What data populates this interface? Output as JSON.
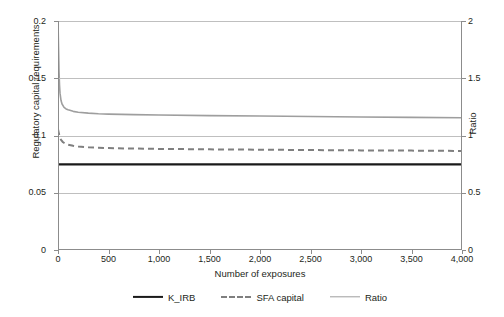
{
  "chart_data": {
    "type": "line",
    "title": "",
    "xlabel": "Number of exposures",
    "ylabel": "Regulatory capital requirements",
    "y2label": "Ratio",
    "xlim": [
      0,
      4000
    ],
    "ylim": [
      0,
      0.2
    ],
    "y2lim": [
      0,
      2
    ],
    "grid": true,
    "legend_position": "bottom",
    "xticks": [
      0,
      500,
      1000,
      1500,
      2000,
      2500,
      3000,
      3500,
      4000
    ],
    "xticklabels": [
      "0",
      "500",
      "1,000",
      "1,500",
      "2,000",
      "2,500",
      "3,000",
      "3,500",
      "4,000"
    ],
    "yticks": [
      0,
      0.05,
      0.1,
      0.15,
      0.2
    ],
    "yticklabels": [
      "0",
      "0.05",
      "0.1",
      "0.15",
      "0.2"
    ],
    "y2ticks": [
      0,
      0.5,
      1,
      1.5,
      2
    ],
    "y2ticklabels": [
      "0",
      "0.5",
      "1",
      "1.5",
      "2"
    ],
    "series": [
      {
        "name": "K_IRB",
        "axis": "left",
        "style": "solid",
        "color": "#1a1a1a",
        "width": 2.2,
        "x": [
          0,
          25,
          50,
          100,
          200,
          300,
          500,
          750,
          1000,
          1500,
          2000,
          2500,
          3000,
          3500,
          4000
        ],
        "values": [
          0.0748,
          0.0748,
          0.0748,
          0.0748,
          0.0748,
          0.0748,
          0.0748,
          0.0748,
          0.0748,
          0.0748,
          0.0748,
          0.0748,
          0.0748,
          0.0748,
          0.0748
        ]
      },
      {
        "name": "SFA capital",
        "axis": "left",
        "style": "dashed",
        "color": "#7f7f7f",
        "width": 2.0,
        "x": [
          0,
          10,
          20,
          30,
          50,
          75,
          100,
          150,
          200,
          300,
          400,
          500,
          750,
          1000,
          1500,
          2000,
          2500,
          3000,
          3500,
          4000
        ],
        "values": [
          0.1055,
          0.1012,
          0.098,
          0.0962,
          0.0941,
          0.0928,
          0.092,
          0.091,
          0.0904,
          0.0897,
          0.0893,
          0.089,
          0.0886,
          0.0883,
          0.0879,
          0.0876,
          0.0873,
          0.087,
          0.0868,
          0.0865
        ]
      },
      {
        "name": "Ratio",
        "axis": "right",
        "style": "solid",
        "color": "#9e9e9e",
        "width": 1.6,
        "x": [
          0,
          5,
          10,
          15,
          20,
          30,
          40,
          60,
          80,
          100,
          150,
          200,
          300,
          400,
          500,
          750,
          1000,
          1500,
          2000,
          2500,
          3000,
          3500,
          4000
        ],
        "values": [
          2.0,
          1.78,
          1.56,
          1.44,
          1.37,
          1.305,
          1.275,
          1.246,
          1.232,
          1.224,
          1.211,
          1.203,
          1.195,
          1.19,
          1.187,
          1.182,
          1.179,
          1.174,
          1.17,
          1.166,
          1.162,
          1.158,
          1.155
        ]
      }
    ]
  },
  "legend": {
    "items": [
      {
        "label": "K_IRB",
        "style": "solid-black"
      },
      {
        "label": "SFA capital",
        "style": "dashed-gray"
      },
      {
        "label": "Ratio",
        "style": "solid-gray"
      }
    ]
  },
  "caption": ""
}
